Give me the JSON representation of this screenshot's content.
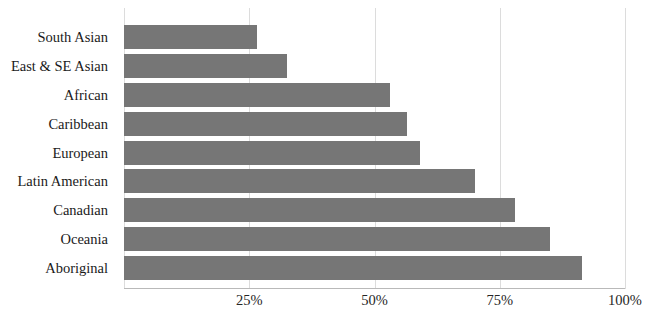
{
  "chart_data": {
    "type": "bar",
    "orientation": "horizontal",
    "title": "",
    "subtitle": "",
    "xlabel": "",
    "ylabel": "",
    "categories": [
      "South Asian",
      "East & SE Asian",
      "African",
      "Caribbean",
      "European",
      "Latin American",
      "Canadian",
      "Oceania",
      "Aboriginal"
    ],
    "values": [
      26.5,
      32.5,
      53,
      56.5,
      59,
      70,
      78,
      85,
      91.5
    ],
    "value_unit": "%",
    "xlim": [
      0,
      100
    ],
    "xticks": [
      25,
      50,
      75,
      100
    ],
    "xtick_labels": [
      "25%",
      "50%",
      "75%",
      "100%"
    ],
    "grid": true,
    "grid_axis": "x",
    "legend": null,
    "legend_position": "none",
    "bar_color": "#767676",
    "grid_color": "#dcdcdc",
    "axis_color": "#b9b9b9",
    "background_color": "#ffffff"
  }
}
